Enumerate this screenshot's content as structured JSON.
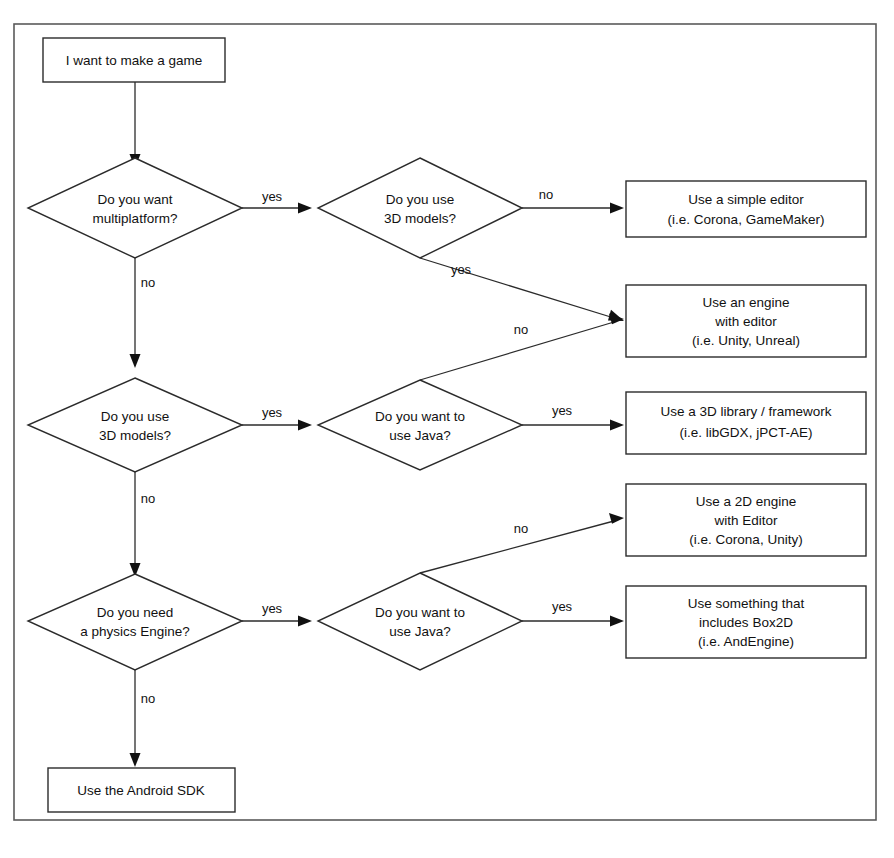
{
  "diagram": {
    "title": "I want to make a game",
    "frame": {
      "border_color": "#5a5a5a",
      "background": "#ffffff"
    },
    "stroke_color": "#2b2b2b",
    "text_color": "#111111"
  },
  "nodes": {
    "start": {
      "label": "I want to make a game"
    },
    "d_multiplatform": {
      "line1": "Do you want",
      "line2": "multiplatform?"
    },
    "d_3d_top": {
      "line1": "Do you use",
      "line2": "3D models?"
    },
    "d_3d_mid": {
      "line1": "Do you use",
      "line2": "3D models?"
    },
    "d_java_mid": {
      "line1": "Do you want to",
      "line2": "use Java?"
    },
    "d_physics": {
      "line1": "Do you need",
      "line2": "a physics Engine?"
    },
    "d_java_bottom": {
      "line1": "Do you want to",
      "line2": "use Java?"
    },
    "r_simple_editor": {
      "line1": "Use a simple editor",
      "line2": "(i.e. Corona, GameMaker)"
    },
    "r_engine_editor": {
      "line1": "Use an engine",
      "line2": "with editor",
      "line3": "(i.e. Unity, Unreal)"
    },
    "r_3d_library": {
      "line1": "Use a 3D library / framework",
      "line2": "(i.e. libGDX, jPCT-AE)"
    },
    "r_2d_engine": {
      "line1": "Use a 2D engine",
      "line2": "with Editor",
      "line3": "(i.e. Corona, Unity)"
    },
    "r_box2d": {
      "line1": "Use something that",
      "line2": "includes Box2D",
      "line3": "(i.e. AndEngine)"
    },
    "r_android_sdk": {
      "label": "Use the Android SDK"
    }
  },
  "edge_labels": {
    "multiplatform_yes": "yes",
    "multiplatform_no": "no",
    "3d_top_no": "no",
    "3d_top_yes": "yes",
    "java_mid_no": "no",
    "3d_mid_yes": "yes",
    "3d_mid_no": "no",
    "java_mid_yes": "yes",
    "physics_yes": "yes",
    "physics_no": "no",
    "java_bottom_no": "no",
    "java_bottom_yes": "yes"
  }
}
